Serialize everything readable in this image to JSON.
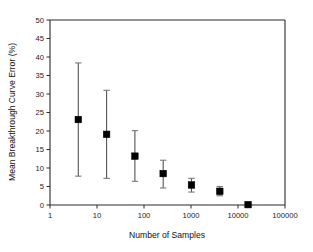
{
  "chart_data": {
    "type": "scatter",
    "title": "",
    "xlabel": "Number of Samples",
    "ylabel": "Mean Breakthrough Curve Error (%)",
    "x_scale": "log",
    "y_scale": "linear",
    "xlim": [
      1,
      100000
    ],
    "ylim": [
      0,
      50
    ],
    "grid": false,
    "legend": null,
    "x_tick_labels": [
      "1",
      "10",
      "100",
      "1000",
      "10000",
      "100000"
    ],
    "x_tick_values": [
      1,
      10,
      100,
      1000,
      10000,
      100000
    ],
    "y_tick_labels": [
      "0",
      "5",
      "10",
      "15",
      "20",
      "25",
      "30",
      "35",
      "40",
      "45",
      "50"
    ],
    "y_tick_values": [
      0,
      5,
      10,
      15,
      20,
      25,
      30,
      35,
      40,
      45,
      50
    ],
    "marker_style": "filled-square",
    "error_bars": "vertical",
    "x": [
      4,
      16,
      64,
      256,
      1024,
      4096,
      16384
    ],
    "values": [
      23.1,
      19.1,
      13.2,
      8.5,
      5.4,
      3.7,
      0.1
    ],
    "y_err_low": [
      15.3,
      11.9,
      6.8,
      3.9,
      1.9,
      1.2,
      0.1
    ],
    "y_err_high": [
      15.3,
      11.9,
      6.9,
      3.6,
      1.8,
      1.3,
      0.1
    ],
    "y_lower": [
      7.8,
      7.2,
      6.4,
      4.6,
      3.5,
      2.5,
      0.0
    ],
    "y_upper": [
      38.4,
      31.0,
      20.1,
      12.1,
      7.2,
      5.0,
      0.2
    ],
    "series": [
      {
        "name": "Mean Breakthrough Curve Error",
        "points": [
          {
            "x": 4,
            "y": 23.1,
            "low": 7.8,
            "high": 38.4
          },
          {
            "x": 16,
            "y": 19.1,
            "low": 7.2,
            "high": 31.0
          },
          {
            "x": 64,
            "y": 13.2,
            "low": 6.4,
            "high": 20.1
          },
          {
            "x": 256,
            "y": 8.5,
            "low": 4.6,
            "high": 12.1
          },
          {
            "x": 1024,
            "y": 5.4,
            "low": 3.5,
            "high": 7.2
          },
          {
            "x": 4096,
            "y": 3.7,
            "low": 2.5,
            "high": 5.0
          },
          {
            "x": 16384,
            "y": 0.1,
            "low": 0.0,
            "high": 0.2
          }
        ]
      }
    ],
    "colors": {
      "marker": "#000000",
      "error_bar": "#555555",
      "axis": "#2b2b2b",
      "background": "#ffffff"
    }
  }
}
